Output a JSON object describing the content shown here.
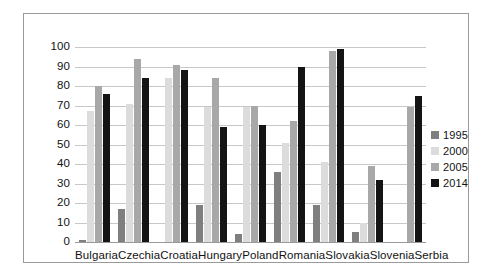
{
  "chart_data": {
    "type": "bar",
    "title": "",
    "xlabel": "",
    "ylabel": "",
    "ylim": [
      0,
      100
    ],
    "ytick_step": 10,
    "yticks": [
      100,
      90,
      80,
      70,
      60,
      50,
      40,
      30,
      20,
      10,
      0
    ],
    "grid": true,
    "legend_position": "right",
    "categories": [
      "Bulgaria",
      "Czechia",
      "Croatia",
      "Hungary",
      "Poland",
      "Romania",
      "Slovakia",
      "Slovenia",
      "Serbia"
    ],
    "series": [
      {
        "name": "1995",
        "color": "#7f7f7f",
        "values": [
          1,
          17,
          null,
          19,
          4,
          36,
          19,
          5,
          null
        ]
      },
      {
        "name": "2000",
        "color": "#dcdcdc",
        "values": [
          67,
          71,
          84,
          69,
          69,
          51,
          41,
          10,
          null
        ]
      },
      {
        "name": "2005",
        "color": "#a8a8a8",
        "values": [
          80,
          94,
          91,
          84,
          70,
          62,
          98,
          39,
          69
        ]
      },
      {
        "name": "2014",
        "color": "#141414",
        "values": [
          76,
          84,
          88,
          59,
          60,
          90,
          99,
          32,
          75
        ]
      }
    ]
  },
  "legend": {
    "entries": [
      {
        "label": "1995",
        "color": "#7f7f7f"
      },
      {
        "label": "2000",
        "color": "#dcdcdc"
      },
      {
        "label": "2005",
        "color": "#a8a8a8"
      },
      {
        "label": "2014",
        "color": "#141414"
      }
    ]
  },
  "frame": {
    "border_color": "#9a9a9a",
    "background": "#ffffff",
    "gridline_color": "#c8c8c8"
  }
}
